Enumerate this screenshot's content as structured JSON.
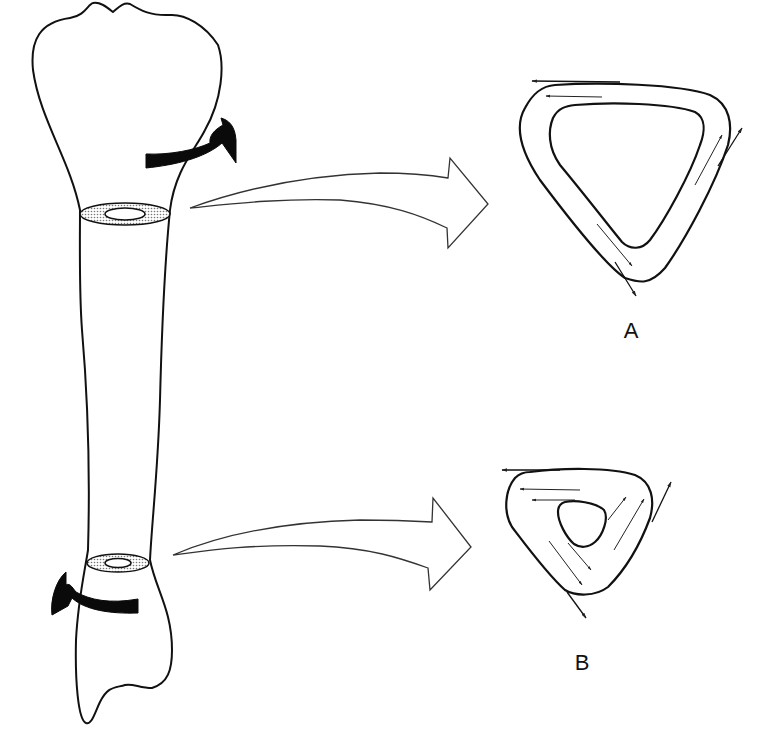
{
  "figure": {
    "colors": {
      "line": "#111111",
      "fill": "#ffffff",
      "torque_arrow": "#0a0a0a",
      "stipple": "#888888"
    }
  },
  "bone": {
    "name": "long bone",
    "torque_arrows": [
      {
        "id": "proximal",
        "direction": "clockwise"
      },
      {
        "id": "distal",
        "direction": "counter-clockwise"
      }
    ],
    "section_markers": [
      {
        "id": "proximal-section",
        "target": "A"
      },
      {
        "id": "distal-section",
        "target": "B"
      }
    ]
  },
  "cross_sections": [
    {
      "id": "A",
      "label": "A",
      "wall": "thin",
      "medullary_cavity": "large",
      "stress_arrows": 6
    },
    {
      "id": "B",
      "label": "B",
      "wall": "thick",
      "medullary_cavity": "small",
      "stress_arrows": 9
    }
  ],
  "pointer_arrows": [
    {
      "from": "proximal-section",
      "to": "A"
    },
    {
      "from": "distal-section",
      "to": "B"
    }
  ]
}
